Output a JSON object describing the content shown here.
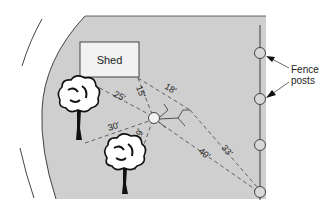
{
  "diagram": {
    "type": "yard-layout-measurement",
    "shed_label": "Shed",
    "fence_label_line1": "Fence",
    "fence_label_line2": "posts",
    "measurements": {
      "shed_left_corner": "25'",
      "shed_right_corner_short": "15'",
      "shed_right_corner_far": "18'",
      "tree_left": "30'",
      "tree_bottom": "29'",
      "fence_post_4_a": "40'",
      "fence_post_4_b": "33'"
    },
    "colors": {
      "yard_fill": "#cfcfcf",
      "shed_fill": "#f2f2f2",
      "line": "#555555",
      "dashed": "#555555",
      "point_fill": "#f4f4f4"
    }
  }
}
